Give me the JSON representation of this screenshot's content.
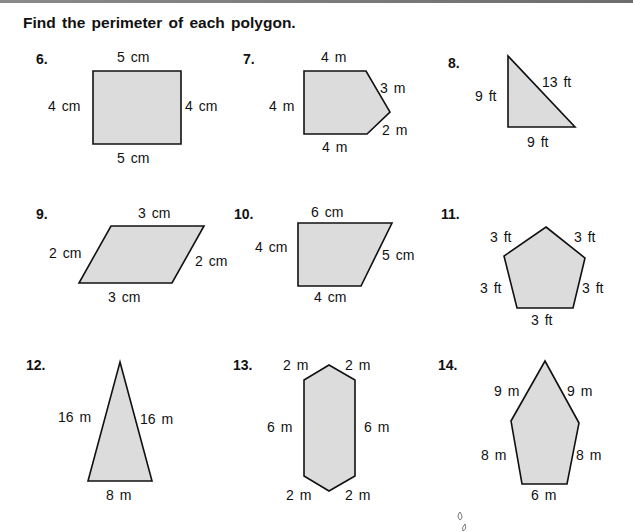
{
  "heading": "Find the perimeter of each polygon.",
  "colors": {
    "fill": "#dcdcdc",
    "stroke": "#111111"
  },
  "problems": [
    {
      "number": "6.",
      "shape": "rectangle",
      "labels": {
        "top": "5 cm",
        "left": "4 cm",
        "right": "4 cm",
        "bottom": "5 cm"
      }
    },
    {
      "number": "7.",
      "shape": "pentagon",
      "labels": {
        "top": "4 m",
        "left": "4 m",
        "upper_right": "3 m",
        "lower_right": "2 m",
        "bottom": "4 m"
      }
    },
    {
      "number": "8.",
      "shape": "right-triangle",
      "labels": {
        "left": "9 ft",
        "hypotenuse": "13 ft",
        "bottom": "9 ft"
      }
    },
    {
      "number": "9.",
      "shape": "parallelogram",
      "labels": {
        "top": "3 cm",
        "left": "2 cm",
        "right": "2 cm",
        "bottom": "3 cm"
      }
    },
    {
      "number": "10.",
      "shape": "trapezoid",
      "labels": {
        "top": "6 cm",
        "left": "4 cm",
        "right": "5 cm",
        "bottom": "4 cm"
      }
    },
    {
      "number": "11.",
      "shape": "regular-pentagon",
      "labels": {
        "upper_left": "3 ft",
        "upper_right": "3 ft",
        "lower_left": "3 ft",
        "lower_right": "3 ft",
        "bottom": "3 ft"
      }
    },
    {
      "number": "12.",
      "shape": "isosceles-triangle",
      "labels": {
        "left": "16 m",
        "right": "16 m",
        "bottom": "8 m"
      }
    },
    {
      "number": "13.",
      "shape": "hexagon",
      "labels": {
        "top_left": "2 m",
        "top_right": "2 m",
        "left": "6 m",
        "right": "6 m",
        "bottom_left": "2 m",
        "bottom_right": "2 m"
      }
    },
    {
      "number": "14.",
      "shape": "pentagon",
      "labels": {
        "upper_left": "9 m",
        "upper_right": "9 m",
        "lower_left": "8 m",
        "lower_right": "8 m",
        "bottom": "6 m"
      }
    }
  ]
}
